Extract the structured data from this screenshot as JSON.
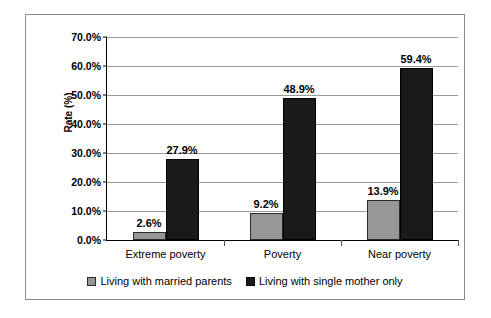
{
  "chart_data": {
    "type": "bar",
    "title": "",
    "subtitle": "",
    "xlabel": "",
    "ylabel": "Rate (%)",
    "ylim": [
      0,
      70
    ],
    "ytick_labels": [
      "0.0%",
      "10.0%",
      "20.0%",
      "30.0%",
      "40.0%",
      "50.0%",
      "60.0%",
      "70.0%"
    ],
    "ytick_values": [
      0,
      10,
      20,
      30,
      40,
      50,
      60,
      70
    ],
    "grid": true,
    "legend_position": "bottom",
    "categories": [
      "Extreme poverty",
      "Poverty",
      "Near poverty"
    ],
    "series": [
      {
        "name": "Living with married parents",
        "color": "#969696",
        "values": [
          2.6,
          9.2,
          13.9
        ],
        "labels": [
          "2.6%",
          "9.2%",
          "13.9%"
        ]
      },
      {
        "name": "Living with single mother only",
        "color": "#1a1a1a",
        "values": [
          27.9,
          48.9,
          59.4
        ],
        "labels": [
          "27.9%",
          "48.9%",
          "59.4%"
        ]
      }
    ]
  },
  "axis": {
    "y_title": "Rate (%)"
  },
  "legend": {
    "items": [
      {
        "label": "Living with married parents",
        "swatch": "legend-swatch-married-parents"
      },
      {
        "label": "Living with single mother only",
        "swatch": "legend-swatch-single-mother"
      }
    ]
  }
}
